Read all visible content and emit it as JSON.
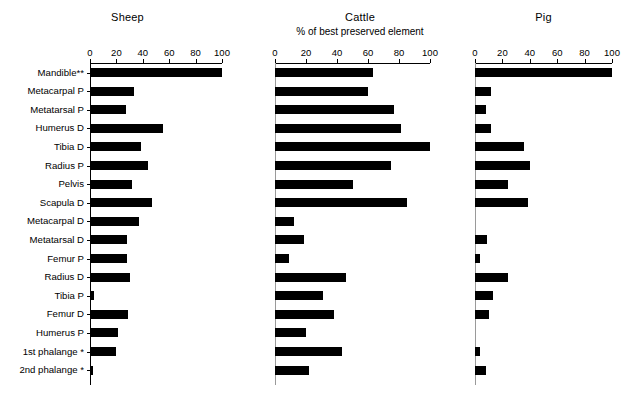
{
  "figure": {
    "axis_subtitle": "% of best preserved element",
    "tick_labels": [
      "0",
      "20",
      "40",
      "60",
      "80",
      "100"
    ],
    "tick_values": [
      0,
      20,
      40,
      60,
      80,
      100
    ],
    "row_labels": [
      "Mandible**",
      "Metacarpal P",
      "Metatarsal P",
      "Humerus D",
      "Tibia D",
      "Radius P",
      "Pelvis",
      "Scapula D",
      "Metacarpal D",
      "Metatarsal D",
      "Femur P",
      "Radius D",
      "Tibia P",
      "Femur D",
      "Humerus P",
      "1st phalange *",
      "2nd phalange *"
    ]
  },
  "chart_data": [
    {
      "type": "bar",
      "orientation": "horizontal",
      "title": "Sheep",
      "xlabel": "",
      "ylabel": "",
      "xlim": [
        0,
        100
      ],
      "grid": false,
      "legend": "none",
      "categories": [
        "Mandible**",
        "Metacarpal P",
        "Metatarsal P",
        "Humerus D",
        "Tibia D",
        "Radius P",
        "Pelvis",
        "Scapula D",
        "Metacarpal D",
        "Metatarsal D",
        "Femur P",
        "Radius D",
        "Tibia P",
        "Femur D",
        "Humerus P",
        "1st phalange *",
        "2nd phalange *"
      ],
      "values": [
        100,
        33,
        27,
        55,
        39,
        44,
        32,
        47,
        37,
        28,
        28,
        30,
        3,
        29,
        21,
        20,
        2
      ]
    },
    {
      "type": "bar",
      "orientation": "horizontal",
      "title": "Cattle",
      "subtitle": "% of best preserved element",
      "xlabel": "",
      "ylabel": "",
      "xlim": [
        0,
        100
      ],
      "grid": false,
      "legend": "none",
      "categories": [
        "Mandible**",
        "Metacarpal P",
        "Metatarsal P",
        "Humerus D",
        "Tibia D",
        "Radius P",
        "Pelvis",
        "Scapula D",
        "Metacarpal D",
        "Metatarsal D",
        "Femur P",
        "Radius D",
        "Tibia P",
        "Femur D",
        "Humerus P",
        "1st phalange *",
        "2nd phalange *"
      ],
      "values": [
        63,
        60,
        77,
        81,
        100,
        75,
        50,
        85,
        12,
        19,
        9,
        46,
        31,
        38,
        20,
        43,
        22
      ]
    },
    {
      "type": "bar",
      "orientation": "horizontal",
      "title": "Pig",
      "xlabel": "",
      "ylabel": "",
      "xlim": [
        0,
        100
      ],
      "grid": false,
      "legend": "none",
      "categories": [
        "Mandible**",
        "Metacarpal P",
        "Metatarsal P",
        "Humerus D",
        "Tibia D",
        "Radius P",
        "Pelvis",
        "Scapula D",
        "Metacarpal D",
        "Metatarsal D",
        "Femur P",
        "Radius D",
        "Tibia P",
        "Femur D",
        "Humerus P",
        "1st phalange *",
        "2nd phalange *"
      ],
      "values": [
        100,
        12,
        8,
        12,
        36,
        40,
        24,
        39,
        0,
        9,
        4,
        24,
        13,
        10,
        0,
        4,
        8
      ]
    }
  ]
}
